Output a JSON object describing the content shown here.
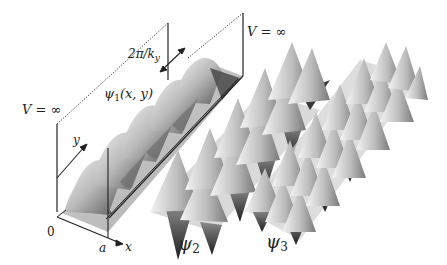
{
  "figure": {
    "labels": {
      "v_left": "V = ∞",
      "v_right": "V = ∞",
      "wavelength": "2π/k",
      "wavelength_sub": "y",
      "psi1": "ψ",
      "psi1_sub": "1",
      "psi1_args": "(x, y)",
      "psi2": "ψ",
      "psi2_sub": "2",
      "psi3": "ψ",
      "psi3_sub": "3",
      "origin": "0",
      "a": "a",
      "x_axis": "x",
      "y_axis": "y"
    },
    "surfaces": [
      {
        "name": "psi1",
        "description": "single-row sinusoidal ridges (ground state along x, periodic along y)",
        "peaks": 5
      },
      {
        "name": "psi2",
        "description": "two-row alternating peaks and troughs"
      },
      {
        "name": "psi3",
        "description": "three-row alternating peaks and troughs"
      }
    ],
    "colors": {
      "background": "#ffffff",
      "lines": "#222222",
      "surface_light": "#e8e8e8",
      "surface_dark": "#2a2a2a"
    }
  }
}
